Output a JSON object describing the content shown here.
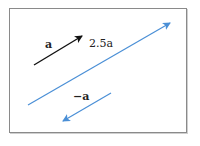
{
  "diagram": {
    "title": "",
    "colors": {
      "frame": "#8a8a8a",
      "vector_a": "#111111",
      "vector_scaled": "#4a8fd6",
      "text": "#222222"
    },
    "vectors": [
      {
        "id": "a",
        "label": "a",
        "x1": 34,
        "y1": 65,
        "x2": 82,
        "y2": 36,
        "color": "#111111"
      },
      {
        "id": "2.5a",
        "label": "2.5a",
        "x1": 28,
        "y1": 105,
        "x2": 170,
        "y2": 23,
        "color": "#4a8fd6"
      },
      {
        "id": "-a",
        "label": "−a",
        "x1": 111,
        "y1": 93,
        "x2": 63,
        "y2": 121,
        "color": "#4a8fd6"
      }
    ],
    "labels": {
      "a": "a",
      "scaled": "2.5a",
      "neg": "−a"
    }
  }
}
